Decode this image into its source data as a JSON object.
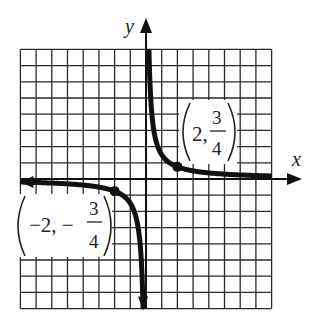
{
  "chart_data": {
    "type": "line",
    "title": "",
    "function": "y = 3/(2x)",
    "xlabel": "x",
    "ylabel": "y",
    "xlim": [
      -8,
      8
    ],
    "ylim": [
      -8,
      8
    ],
    "grid": true,
    "grid_step": 1,
    "asymptotes": {
      "vertical": 0,
      "horizontal": 0
    },
    "series": [
      {
        "name": "upper branch (x > 0)",
        "x": [
          0.1875,
          0.25,
          0.375,
          0.5,
          0.75,
          1,
          1.5,
          2,
          3,
          4,
          6,
          8
        ],
        "y": [
          8,
          6,
          4,
          3,
          2,
          1.5,
          1,
          0.75,
          0.5,
          0.375,
          0.25,
          0.1875
        ]
      },
      {
        "name": "lower branch (x < 0)",
        "x": [
          -8,
          -6,
          -4,
          -3,
          -2,
          -1.5,
          -1,
          -0.75,
          -0.5,
          -0.375,
          -0.25,
          -0.1875
        ],
        "y": [
          -0.1875,
          -0.25,
          -0.375,
          -0.5,
          -0.75,
          -1,
          -1.5,
          -2,
          -3,
          -4,
          -6,
          -8
        ]
      }
    ],
    "annotations": [
      {
        "point": [
          2,
          0.75
        ],
        "label": "(2, 3/4)"
      },
      {
        "point": [
          -2,
          -0.75
        ],
        "label": "(−2, −3/4)"
      }
    ]
  },
  "labels": {
    "x_axis": "x",
    "y_axis": "y",
    "p1": {
      "open": "(",
      "x": "2,",
      "num": "3",
      "den": "4",
      "close": ")"
    },
    "p2": {
      "open": "(",
      "x": "−2, −",
      "num": "3",
      "den": "4",
      "close": ")"
    }
  },
  "colors": {
    "ink": "#111111",
    "grid": "#2a2a2a",
    "background": "#ffffff"
  }
}
